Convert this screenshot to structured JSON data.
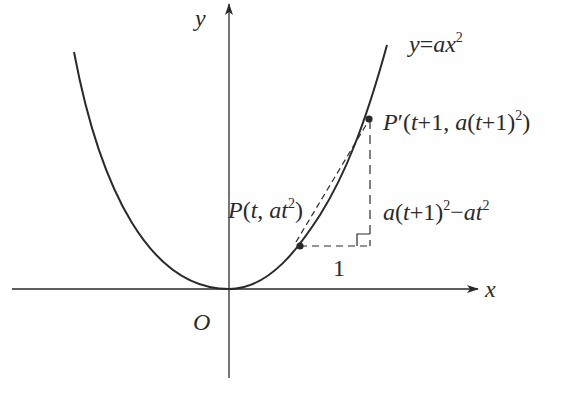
{
  "figure": {
    "curve_label": {
      "parts": [
        [
          "y",
          "i"
        ],
        [
          "=",
          "n"
        ],
        [
          "ax",
          "i"
        ]
      ],
      "sup": "2"
    },
    "axis_labels": {
      "x": "x",
      "y": "y",
      "origin": "O"
    },
    "point_P": {
      "name": "P",
      "coords_text": "(t, at²)"
    },
    "point_P_prime": {
      "name": "P′",
      "coords_text": "(t+1, a(t+1)²)"
    },
    "run_label": "1",
    "rise_label": "a(t+1)²−at²",
    "colors": {
      "ink": "#2a2a2a",
      "background": "#ffffff"
    }
  }
}
